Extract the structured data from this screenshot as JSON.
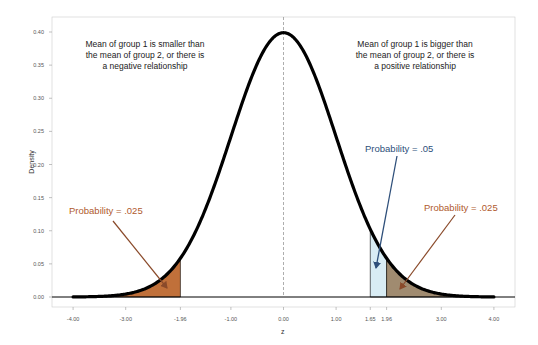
{
  "chart_data": {
    "type": "line",
    "title": "",
    "xlabel": "z",
    "ylabel": "Density",
    "xlim": [
      -4.4,
      4.4
    ],
    "ylim": [
      -0.015,
      0.42
    ],
    "grid": false,
    "legend": null,
    "x_ticks": [
      -4.0,
      -3.0,
      -1.96,
      -1.0,
      0.0,
      1.0,
      1.65,
      1.96,
      3.0,
      4.0
    ],
    "x_tick_labels": [
      "-4.00",
      "-3.00",
      "-1.96",
      "-1.00",
      "0.00",
      "1.00",
      "1.65",
      "1.96",
      "3.00",
      "4.00"
    ],
    "y_ticks": [
      0.0,
      0.05,
      0.1,
      0.15,
      0.2,
      0.25,
      0.3,
      0.35,
      0.4
    ],
    "y_tick_labels": [
      "0.00",
      "0.05",
      "0.10",
      "0.15",
      "0.20",
      "0.25",
      "0.30",
      "0.35",
      "0.40"
    ],
    "series": [
      {
        "name": "Standard normal density",
        "x": [
          -4.0,
          -3.5,
          -3.0,
          -2.5,
          -2.0,
          -1.96,
          -1.65,
          -1.5,
          -1.0,
          -0.5,
          0.0,
          0.5,
          1.0,
          1.5,
          1.65,
          1.96,
          2.0,
          2.5,
          3.0,
          3.5,
          4.0
        ],
        "values": [
          0.0001,
          0.0009,
          0.0044,
          0.0175,
          0.054,
          0.0584,
          0.1023,
          0.1295,
          0.242,
          0.3521,
          0.3989,
          0.3521,
          0.242,
          0.1295,
          0.1023,
          0.0584,
          0.054,
          0.0175,
          0.0044,
          0.0009,
          0.0001
        ]
      }
    ],
    "shaded_regions": [
      {
        "from": -4.0,
        "to": -1.96,
        "color": "#c0703a",
        "label": "Probability = .025"
      },
      {
        "from": 1.65,
        "to": 1.96,
        "color": "#d8ecf4",
        "label": "Probability = .05 (with region beyond 1.96)"
      },
      {
        "from": 1.96,
        "to": 4.0,
        "color": "#a08b70",
        "label": "Probability = .025"
      }
    ],
    "reference_line": {
      "x": 0.0,
      "style": "dashed",
      "color": "#999999"
    },
    "annotations": [
      {
        "text": "Mean of group 1 is smaller than the mean of group 2, or there is a negative relationship",
        "position": "top-left"
      },
      {
        "text": "Mean of group 1 is bigger than the mean of group 2, or there is a positive relationship",
        "position": "top-right"
      },
      {
        "text": "Probability = .025",
        "color": "#b05a2e",
        "arrow_to": [
          -2.3,
          0.02
        ]
      },
      {
        "text": "Probability = .05",
        "color": "#2e4f7a",
        "arrow_to": [
          1.8,
          0.02
        ]
      },
      {
        "text": "Probability = .025",
        "color": "#b05a2e",
        "arrow_to": [
          2.2,
          0.01
        ]
      }
    ]
  },
  "labels": {
    "xlabel": "z",
    "ylabel": "Density",
    "note_left_lines": [
      "Mean of group 1 is smaller than",
      "the mean of group 2, or there is",
      "a negative relationship"
    ],
    "note_right_lines": [
      "Mean of group 1 is bigger than",
      "the mean of group 2, or there is",
      "a positive relationship"
    ],
    "prob_left": "Probability = .025",
    "prob_mid": "Probability = .05",
    "prob_right": "Probability = .025"
  },
  "colors": {
    "curve": "#000000",
    "left_tail": "#c0703a",
    "mid_band": "#d8ecf4",
    "right_tail": "#a08b70",
    "arrow_brown": "#8a4a2a",
    "arrow_blue": "#2e4f7a",
    "text_brown": "#b05a2e",
    "text_blue": "#2e4f7a"
  }
}
